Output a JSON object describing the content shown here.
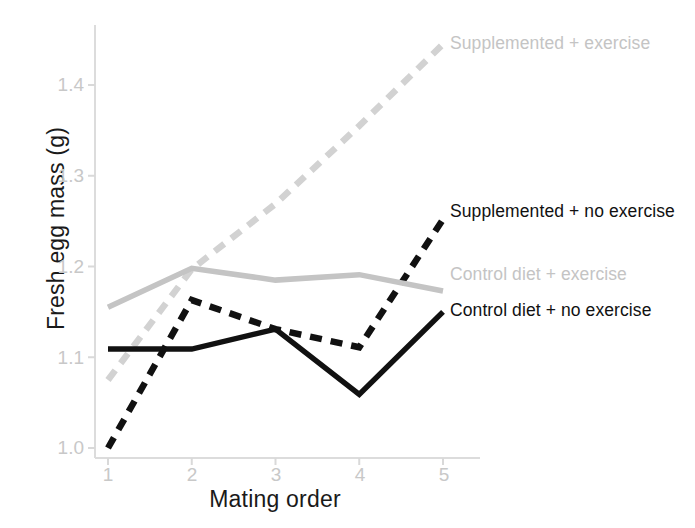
{
  "chart_data": {
    "type": "line",
    "title": "",
    "xlabel": "Mating order",
    "ylabel": "Fresh egg mass (g)",
    "x": [
      1,
      2,
      3,
      4,
      5
    ],
    "xticklabels": [
      "1",
      "2",
      "3",
      "4",
      "5"
    ],
    "yticks": [
      1.0,
      1.1,
      1.2,
      1.3,
      1.4
    ],
    "yticklabels": [
      "1.0",
      "1.1",
      "1.2",
      "1.3",
      "1.4"
    ],
    "xlim": [
      0.8,
      5.25
    ],
    "ylim": [
      0.985,
      1.465
    ],
    "grid": false,
    "legend_position": "right-inline-annotations",
    "series": [
      {
        "name": "Supplemented + exercise",
        "values": [
          1.075,
          1.197,
          1.269,
          1.355,
          1.445
        ],
        "color": "#d2d2d2",
        "style": "dashed",
        "label_x": 5.05,
        "label_y": 1.447
      },
      {
        "name": "Supplemented + no exercise",
        "values": [
          1.0,
          1.163,
          1.131,
          1.111,
          1.252
        ],
        "color": "#111111",
        "style": "dashed",
        "label_x": 5.05,
        "label_y": 1.252
      },
      {
        "name": "Control diet + exercise",
        "values": [
          1.155,
          1.198,
          1.185,
          1.191,
          1.173
        ],
        "color": "#c4c4c4",
        "style": "solid",
        "label_x": 5.05,
        "label_y": 1.178
      },
      {
        "name": "Control diet + no exercise",
        "values": [
          1.109,
          1.109,
          1.131,
          1.059,
          1.15
        ],
        "color": "#111111",
        "style": "solid",
        "label_x": 5.05,
        "label_y": 1.135
      }
    ],
    "axis_color": "#d9d9d9",
    "tick_label_color": "#c8c8c8",
    "axis_title_color": "#1a1a1a"
  },
  "ytick_positions": [
    {
      "label": "1.4",
      "top": 74
    },
    {
      "label": "1.3",
      "top": 165
    },
    {
      "label": "1.2",
      "top": 256
    },
    {
      "label": "1.1",
      "top": 347
    },
    {
      "label": "1.0",
      "top": 437
    }
  ],
  "xtick_positions": [
    {
      "label": "1",
      "left": 96
    },
    {
      "label": "2",
      "left": 180
    },
    {
      "label": "3",
      "left": 264
    },
    {
      "label": "4",
      "left": 348
    },
    {
      "label": "5",
      "left": 432
    }
  ],
  "series_labels": [
    {
      "text": "Supplemented + exercise",
      "left": 450,
      "top": 33,
      "tone": "light"
    },
    {
      "text": "Supplemented + no exercise",
      "left": 450,
      "top": 201,
      "tone": "dark"
    },
    {
      "text": "Control diet + exercise",
      "left": 450,
      "top": 264,
      "tone": "light"
    },
    {
      "text": "Control diet + no exercise",
      "left": 450,
      "top": 300,
      "tone": "dark"
    }
  ]
}
